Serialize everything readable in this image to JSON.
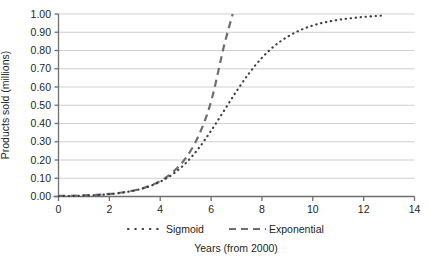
{
  "chart_data": {
    "type": "line",
    "title": "",
    "subtitle": "",
    "xlabel": "Years (from 2000)",
    "ylabel": "Products sold (millions)",
    "xlim": [
      0,
      14
    ],
    "ylim": [
      0,
      1.0
    ],
    "grid": "horizontal",
    "legend_position": "bottom",
    "x_ticks": [
      "0",
      "2",
      "4",
      "6",
      "8",
      "10",
      "12",
      "14"
    ],
    "x_tick_values": [
      0,
      2,
      4,
      6,
      8,
      10,
      12,
      14
    ],
    "y_ticks": [
      "0.00",
      "0.10",
      "0.20",
      "0.30",
      "0.40",
      "0.50",
      "0.60",
      "0.70",
      "0.80",
      "0.90",
      "1.00"
    ],
    "y_tick_values": [
      0.0,
      0.1,
      0.2,
      0.3,
      0.4,
      0.5,
      0.6,
      0.7,
      0.8,
      0.9,
      1.0
    ],
    "series": [
      {
        "name": "Sigmoid",
        "style": "dotted",
        "color": "#3b3b3b",
        "x": [
          0,
          0.5,
          1,
          1.5,
          2,
          2.5,
          3,
          3.5,
          4,
          4.5,
          5,
          5.5,
          6,
          6.5,
          7,
          7.5,
          8,
          8.5,
          9,
          9.5,
          10,
          10.5,
          11,
          11.5,
          12,
          12.5,
          12.8
        ],
        "y": [
          0.002,
          0.003,
          0.005,
          0.008,
          0.013,
          0.021,
          0.033,
          0.052,
          0.081,
          0.123,
          0.182,
          0.262,
          0.36,
          0.468,
          0.577,
          0.676,
          0.76,
          0.826,
          0.875,
          0.911,
          0.937,
          0.955,
          0.968,
          0.977,
          0.984,
          0.989,
          0.991
        ]
      },
      {
        "name": "Exponential",
        "style": "dashed",
        "color": "#6d6e71",
        "x": [
          0,
          0.5,
          1,
          1.5,
          2,
          2.5,
          3,
          3.5,
          4,
          4.5,
          5,
          5.5,
          6,
          6.5,
          6.85
        ],
        "y": [
          0.003,
          0.004,
          0.006,
          0.009,
          0.014,
          0.022,
          0.034,
          0.054,
          0.085,
          0.134,
          0.21,
          0.33,
          0.52,
          0.82,
          1.0
        ]
      }
    ],
    "legend": [
      {
        "label": "Sigmoid",
        "marker": "dotted"
      },
      {
        "label": "Exponential",
        "marker": "dashed"
      }
    ],
    "colors": {
      "sigmoid": "#3b3b3b",
      "exponential": "#6d6e71",
      "gridline": "#c9cacc",
      "axis": "#6d6e71",
      "text": "#231f20",
      "background": "#ffffff"
    }
  }
}
